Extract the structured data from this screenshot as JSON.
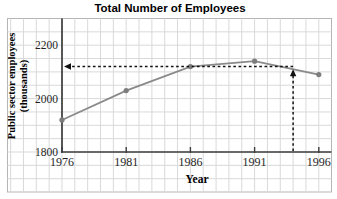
{
  "chart_data": {
    "type": "line",
    "title": "Total Number of Employees",
    "xlabel": "Year",
    "ylabel_line1": "Public sector employees",
    "ylabel_line2": "(thousands)",
    "x": [
      1976,
      1981,
      1986,
      1991,
      1996
    ],
    "series": [
      {
        "name": "Public sector employees (thousands)",
        "values": [
          1920,
          2030,
          2120,
          2140,
          2090
        ]
      }
    ],
    "x_ticks": [
      "1976",
      "1981",
      "1986",
      "1991",
      "1996"
    ],
    "y_ticks": [
      "1800",
      "2000",
      "2200"
    ],
    "y_tick_values": [
      1800,
      2000,
      2200
    ],
    "xlim": [
      1976,
      1996
    ],
    "ylim": [
      1800,
      2300
    ],
    "grid": true,
    "grid_step_years": 1,
    "grid_step_units": 50,
    "legend_position": "none",
    "annotation": {
      "type": "dashed-readoff-arrows",
      "x": 1994,
      "y": 2120,
      "description": "dashed vertical arrow up from x-axis at 1994 to the line, dashed horizontal arrow left to the y-axis at about 2120"
    }
  },
  "colors": {
    "background": "#ffffff",
    "grid": "#d9d9d9",
    "plot_border": "#b5b5b5",
    "axis": "#3d3d3d",
    "series_line": "#8a8a8a",
    "marker": "#7d7d7d",
    "annotation": "#111111",
    "title_text": "#000000",
    "tick_text": "#1f1f1f"
  }
}
